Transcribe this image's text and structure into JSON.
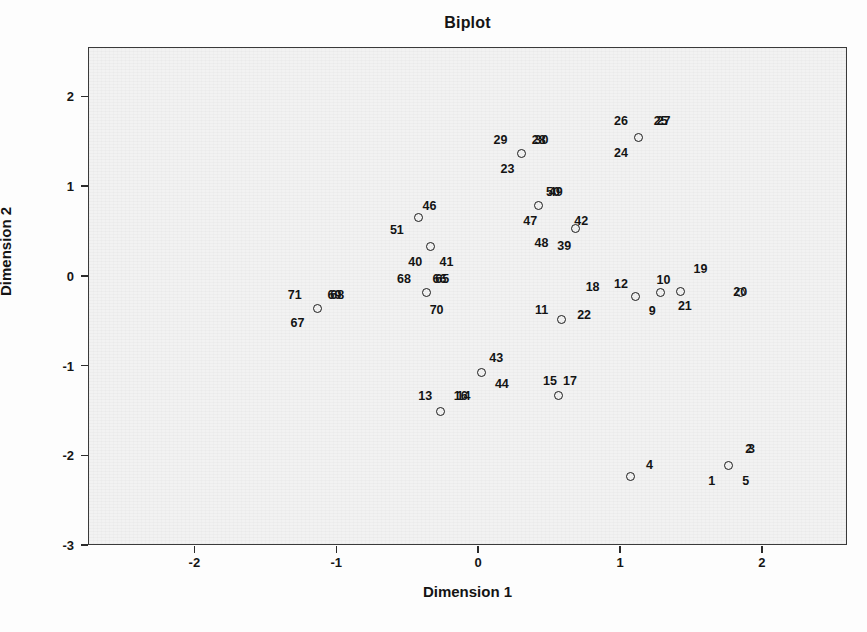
{
  "chart_data": {
    "type": "scatter",
    "title": "Biplot",
    "xlabel": "Dimension 1",
    "ylabel": "Dimension 2",
    "xlim": [
      -2.75,
      2.6
    ],
    "ylim": [
      -3.0,
      2.55
    ],
    "xticks": [
      "-2",
      "-1",
      "0",
      "1",
      "2"
    ],
    "xtick_values": [
      -2,
      -1,
      0,
      1,
      2
    ],
    "yticks": [
      "2",
      "1",
      "0",
      "-1",
      "-2",
      "-3"
    ],
    "ytick_values": [
      2,
      1,
      0,
      -1,
      -2,
      -3
    ],
    "grid": false,
    "legend": "none",
    "marker": "open-circle",
    "points": [
      {
        "label": "1",
        "x": 1.76,
        "y": -2.1,
        "lx": 1.64,
        "ly": -2.28
      },
      {
        "label": "2",
        "x": 1.76,
        "y": -2.1,
        "lx": 1.9,
        "ly": -1.92
      },
      {
        "label": "3",
        "x": 1.76,
        "y": -2.1,
        "lx": 1.92,
        "ly": -1.92
      },
      {
        "label": "5",
        "x": 1.76,
        "y": -2.1,
        "lx": 1.88,
        "ly": -2.28
      },
      {
        "label": "4",
        "x": 1.07,
        "y": -2.23,
        "lx": 1.2,
        "ly": -2.1
      },
      {
        "label": "9",
        "x": 1.28,
        "y": -0.18,
        "lx": 1.22,
        "ly": -0.38
      },
      {
        "label": "10",
        "x": 1.42,
        "y": -0.16,
        "lx": 1.3,
        "ly": -0.03
      },
      {
        "label": "19",
        "x": 1.42,
        "y": -0.16,
        "lx": 1.56,
        "ly": 0.09
      },
      {
        "label": "21",
        "x": 1.42,
        "y": -0.16,
        "lx": 1.45,
        "ly": -0.32
      },
      {
        "label": "20",
        "x": 1.84,
        "y": -0.17,
        "lx": 1.84,
        "ly": -0.17
      },
      {
        "label": "11",
        "x": 0.58,
        "y": -0.48,
        "lx": 0.44,
        "ly": -0.37
      },
      {
        "label": "18",
        "x": 1.1,
        "y": -0.22,
        "lx": 0.8,
        "ly": -0.11
      },
      {
        "label": "12",
        "x": 1.1,
        "y": -0.22,
        "lx": 1.0,
        "ly": -0.08
      },
      {
        "label": "22",
        "x": 1.1,
        "y": -0.22,
        "lx": 0.74,
        "ly": -0.43
      },
      {
        "label": "13",
        "x": -0.27,
        "y": -1.5,
        "lx": -0.38,
        "ly": -1.33
      },
      {
        "label": "16",
        "x": -0.27,
        "y": -1.5,
        "lx": -0.13,
        "ly": -1.33
      },
      {
        "label": "14",
        "x": -0.27,
        "y": -1.5,
        "lx": -0.11,
        "ly": -1.33
      },
      {
        "label": "15",
        "x": 0.56,
        "y": -1.32,
        "lx": 0.5,
        "ly": -1.16
      },
      {
        "label": "17",
        "x": 0.56,
        "y": -1.32,
        "lx": 0.64,
        "ly": -1.16
      },
      {
        "label": "43",
        "x": 0.02,
        "y": -1.07,
        "lx": 0.12,
        "ly": -0.91
      },
      {
        "label": "44",
        "x": 0.02,
        "y": -1.07,
        "lx": 0.16,
        "ly": -1.2
      },
      {
        "label": "23",
        "x": 0.3,
        "y": 1.37,
        "lx": 0.2,
        "ly": 1.2
      },
      {
        "label": "29",
        "x": 0.3,
        "y": 1.37,
        "lx": 0.15,
        "ly": 1.52
      },
      {
        "label": "28",
        "x": 0.3,
        "y": 1.37,
        "lx": 0.42,
        "ly": 1.52
      },
      {
        "label": "30",
        "x": 0.3,
        "y": 1.37,
        "lx": 0.44,
        "ly": 1.52
      },
      {
        "label": "24",
        "x": 1.12,
        "y": 1.55,
        "lx": 1.0,
        "ly": 1.38
      },
      {
        "label": "26",
        "x": 1.12,
        "y": 1.55,
        "lx": 1.0,
        "ly": 1.74
      },
      {
        "label": "25",
        "x": 1.12,
        "y": 1.55,
        "lx": 1.28,
        "ly": 1.74
      },
      {
        "label": "27",
        "x": 1.12,
        "y": 1.55,
        "lx": 1.3,
        "ly": 1.74
      },
      {
        "label": "50",
        "x": 0.42,
        "y": 0.79,
        "lx": 0.52,
        "ly": 0.95
      },
      {
        "label": "49",
        "x": 0.42,
        "y": 0.79,
        "lx": 0.54,
        "ly": 0.95
      },
      {
        "label": "47",
        "x": 0.42,
        "y": 0.79,
        "lx": 0.36,
        "ly": 0.62
      },
      {
        "label": "42",
        "x": 0.68,
        "y": 0.54,
        "lx": 0.72,
        "ly": 0.62
      },
      {
        "label": "48",
        "x": 0.68,
        "y": 0.54,
        "lx": 0.44,
        "ly": 0.38
      },
      {
        "label": "39",
        "x": 0.68,
        "y": 0.54,
        "lx": 0.6,
        "ly": 0.34
      },
      {
        "label": "46",
        "x": -0.43,
        "y": 0.66,
        "lx": -0.35,
        "ly": 0.79
      },
      {
        "label": "51",
        "x": -0.43,
        "y": 0.66,
        "lx": -0.58,
        "ly": 0.52
      },
      {
        "label": "40",
        "x": -0.34,
        "y": 0.34,
        "lx": -0.45,
        "ly": 0.17
      },
      {
        "label": "41",
        "x": -0.34,
        "y": 0.34,
        "lx": -0.23,
        "ly": 0.17
      },
      {
        "label": "70",
        "x": -0.37,
        "y": -0.18,
        "lx": -0.3,
        "ly": -0.37
      },
      {
        "label": "68",
        "x": -0.37,
        "y": -0.18,
        "lx": -0.53,
        "ly": -0.02
      },
      {
        "label": "65",
        "x": -0.37,
        "y": -0.18,
        "lx": -0.26,
        "ly": -0.02
      },
      {
        "label": "66",
        "x": -0.37,
        "y": -0.18,
        "lx": -0.28,
        "ly": -0.02
      },
      {
        "label": "67",
        "x": -1.14,
        "y": -0.35,
        "lx": -1.28,
        "ly": -0.52
      },
      {
        "label": "71",
        "x": -1.14,
        "y": -0.35,
        "lx": -1.3,
        "ly": -0.2
      },
      {
        "label": "69",
        "x": -1.14,
        "y": -0.35,
        "lx": -1.02,
        "ly": -0.2
      },
      {
        "label": "68b",
        "x": -1.14,
        "y": -0.35,
        "lx": -1.0,
        "ly": -0.2
      }
    ]
  }
}
